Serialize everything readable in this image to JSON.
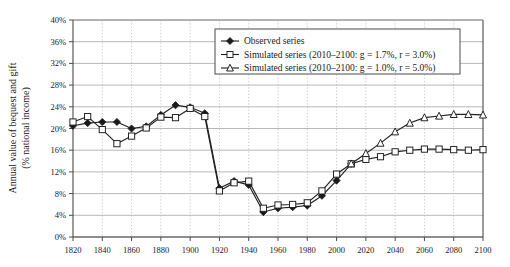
{
  "chart_data": {
    "type": "line",
    "title": "",
    "xlabel": "",
    "ylabel": "Annual value of bequest and gift (% national income)",
    "ylabel_line1": "Annual value of bequest and gift",
    "ylabel_line2": "(% national income)",
    "xlim": [
      1820,
      2100
    ],
    "ylim": [
      0,
      40
    ],
    "xticks": [
      1820,
      1840,
      1860,
      1880,
      1900,
      1920,
      1940,
      1960,
      1980,
      2000,
      2020,
      2040,
      2060,
      2080,
      2100
    ],
    "xticklabels": [
      "1820",
      "1840",
      "1860",
      "1880",
      "1900",
      "1920",
      "1940",
      "1960",
      "1980",
      "2000",
      "2020",
      "2040",
      "2060",
      "2080",
      "2100"
    ],
    "yticks": [
      0,
      4,
      8,
      12,
      16,
      20,
      24,
      28,
      32,
      36,
      40
    ],
    "yticklabels": [
      "0%",
      "4%",
      "8%",
      "12%",
      "16%",
      "20%",
      "24%",
      "28%",
      "32%",
      "36%",
      "40%"
    ],
    "grid": "both",
    "legend_position": "top-right",
    "series": [
      {
        "name": "Observed series",
        "marker": "filled-diamond",
        "color": "#222222",
        "x": [
          1820,
          1830,
          1840,
          1850,
          1860,
          1870,
          1880,
          1890,
          1900,
          1910,
          1920,
          1930,
          1940,
          1950,
          1960,
          1970,
          1980,
          1990,
          2000,
          2010
        ],
        "values": [
          20.5,
          21.0,
          21.2,
          21.2,
          20.0,
          20.4,
          22.5,
          24.3,
          23.9,
          22.8,
          9.0,
          10.3,
          9.6,
          4.6,
          5.3,
          5.5,
          5.8,
          7.6,
          10.4,
          13.5
        ]
      },
      {
        "name": "Simulated series (2010–2100: g = 1.7%, r = 3.0%)",
        "marker": "open-square",
        "color": "#222222",
        "g": "1.7%",
        "r": "3.0%",
        "x": [
          1820,
          1830,
          1840,
          1850,
          1860,
          1870,
          1880,
          1890,
          1900,
          1910,
          1920,
          1930,
          1940,
          1950,
          1960,
          1970,
          1980,
          1990,
          2000,
          2010,
          2020,
          2030,
          2040,
          2050,
          2060,
          2070,
          2080,
          2090,
          2100
        ],
        "values": [
          21.2,
          22.2,
          19.8,
          17.2,
          18.6,
          20.1,
          22.1,
          22.0,
          23.7,
          22.2,
          8.5,
          10.0,
          10.3,
          5.3,
          5.9,
          6.0,
          6.3,
          8.5,
          11.6,
          13.5,
          14.3,
          14.8,
          15.7,
          16.0,
          16.2,
          16.2,
          16.1,
          16.0,
          16.1
        ]
      },
      {
        "name": "Simulated series (2010–2100: g = 1.0%, r = 5.0%)",
        "marker": "open-triangle",
        "color": "#222222",
        "g": "1.0%",
        "r": "5.0%",
        "x": [
          2010,
          2020,
          2030,
          2040,
          2050,
          2060,
          2070,
          2080,
          2090,
          2100
        ],
        "values": [
          13.5,
          15.4,
          17.3,
          19.4,
          21.0,
          22.0,
          22.3,
          22.6,
          22.6,
          22.5
        ]
      }
    ],
    "legend": [
      {
        "label": "Observed series",
        "marker": "filled-diamond"
      },
      {
        "label": "Simulated series (2010–2100: g = 1.7%, r = 3.0%)",
        "marker": "open-square"
      },
      {
        "label": "Simulated series (2010–2100: g = 1.0%, r = 5.0%)",
        "marker": "open-triangle"
      }
    ]
  }
}
